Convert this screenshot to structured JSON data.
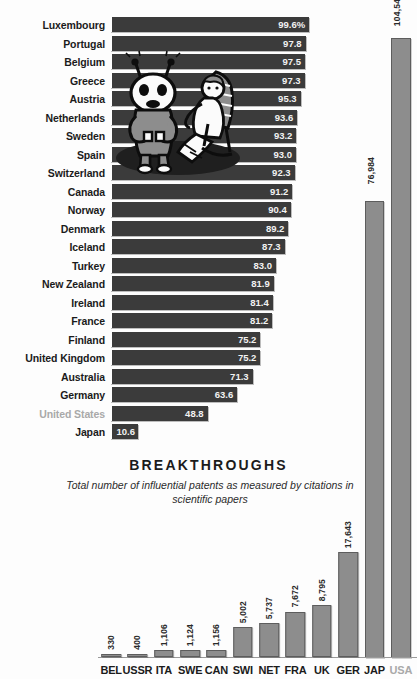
{
  "page": {
    "top_partial_title": "",
    "background": "#ffffff"
  },
  "top_chart": {
    "title_partial": "",
    "unit_suffix": "%",
    "highlight_color": "#a9a9a9",
    "bar_color": "#3b3b3b",
    "illustration_name": "robot-and-reclining-person-illustration"
  },
  "bottom_chart": {
    "title": "BREAKTHROUGHS",
    "subtitle": "Total number of influential patents as measured by citations in scientific papers",
    "bar_color": "#8d8d8d",
    "highlight_color": "#a9a9a9"
  },
  "chart_data": [
    {
      "type": "bar",
      "orientation": "horizontal",
      "id": "top-chart",
      "title": "",
      "xlabel": "",
      "ylabel": "",
      "xlim": [
        0,
        100
      ],
      "grid": false,
      "legend": false,
      "value_suffix_first": "%",
      "highlighted_categories": [
        "United States"
      ],
      "categories": [
        "Luxembourg",
        "Portugal",
        "Belgium",
        "Greece",
        "Austria",
        "Netherlands",
        "Sweden",
        "Spain",
        "Switzerland",
        "Canada",
        "Norway",
        "Denmark",
        "Iceland",
        "Turkey",
        "New Zealand",
        "Ireland",
        "France",
        "Finland",
        "United Kingdom",
        "Australia",
        "Germany",
        "United States",
        "Japan"
      ],
      "values": [
        99.6,
        97.8,
        97.5,
        97.3,
        95.3,
        93.6,
        93.2,
        93.0,
        92.3,
        91.2,
        90.4,
        89.2,
        87.3,
        83.0,
        81.9,
        81.4,
        81.2,
        75.2,
        75.2,
        71.3,
        63.6,
        48.8,
        10.6
      ],
      "value_labels": [
        "99.6%",
        "97.8",
        "97.5",
        "97.3",
        "95.3",
        "93.6",
        "93.2",
        "93.0",
        "92.3",
        "91.2",
        "90.4",
        "89.2",
        "87.3",
        "83.0",
        "81.9",
        "81.4",
        "81.2",
        "75.2",
        "75.2",
        "71.3",
        "63.6",
        "48.8",
        "10.6"
      ]
    },
    {
      "type": "bar",
      "orientation": "vertical",
      "id": "bottom-chart",
      "title": "BREAKTHROUGHS",
      "subtitle": "Total number of influential patents as measured by citations in scientific papers",
      "xlabel": "",
      "ylabel": "",
      "ylim": [
        0,
        104541
      ],
      "grid": false,
      "legend": false,
      "highlighted_categories": [
        "USA"
      ],
      "categories": [
        "BEL",
        "USSR",
        "ITA",
        "SWE",
        "CAN",
        "SWI",
        "NET",
        "FRA",
        "UK",
        "GER",
        "JAP",
        "USA"
      ],
      "values": [
        330,
        400,
        1106,
        1124,
        1156,
        5002,
        5737,
        7672,
        8795,
        17643,
        76984,
        104541
      ],
      "value_labels": [
        "330",
        "400",
        "1,106",
        "1,124",
        "1,156",
        "5,002",
        "5,737",
        "7,672",
        "8,795",
        "17,643",
        "76,984",
        "104,541"
      ]
    }
  ]
}
